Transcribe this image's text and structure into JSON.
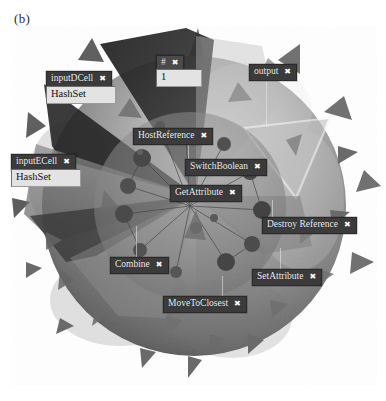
{
  "figure": {
    "panel_label": "(b)",
    "caption_color": "#2b2b2b",
    "background": "#ffffff",
    "width": 386,
    "height": 401
  },
  "scene": {
    "description": "grayscale 3D rendering of a spiky sphere with translucent radial cone wedges",
    "object_name": "spiky-sphere",
    "sphere_fill": "#8d8d8d",
    "sphere_highlight": "#d6d6d6",
    "sphere_shadow": "#4a4a4a",
    "spike_color": "#7a7a7a",
    "wedge_dark": "#2c2c2c",
    "wedge_mid": "#6a6a6a",
    "wedge_light": "#c9c9c9",
    "highlight_outline": "#f2f2f2"
  },
  "labels": [
    {
      "id": "inputdcell",
      "text": "inputDCell",
      "close": "✖",
      "x": 46,
      "y": 71,
      "style": "dark"
    },
    {
      "id": "hash-field-d",
      "text": "HashSet",
      "x": 46,
      "y": 84,
      "kind": "field"
    },
    {
      "id": "hash-symbol",
      "text": "#",
      "close": "✖",
      "x": 156,
      "y": 55,
      "style": "dark"
    },
    {
      "id": "hash-count-field",
      "text": "1",
      "x": 156,
      "y": 68,
      "kind": "field",
      "narrow": true
    },
    {
      "id": "output",
      "text": "output",
      "close": "✖",
      "x": 249,
      "y": 64,
      "style": "dark"
    },
    {
      "id": "hostreference",
      "text": "HostReference",
      "close": "✖",
      "x": 133,
      "y": 128,
      "style": "dark"
    },
    {
      "id": "inputecell",
      "text": "inputECell",
      "close": "✖",
      "x": 11,
      "y": 154,
      "style": "dark"
    },
    {
      "id": "hash-field-e",
      "text": "HashSet",
      "x": 11,
      "y": 167,
      "kind": "field"
    },
    {
      "id": "switchboolean",
      "text": "SwitchBoolean",
      "close": "✖",
      "x": 185,
      "y": 159,
      "style": "dark"
    },
    {
      "id": "getattribute",
      "text": "GetAttribute",
      "close": "✖",
      "x": 170,
      "y": 185,
      "style": "dark"
    },
    {
      "id": "destroyreference",
      "text": "Destroy Reference",
      "close": "✖",
      "x": 262,
      "y": 217,
      "style": "dark"
    },
    {
      "id": "combine",
      "text": "Combine",
      "close": "✖",
      "x": 110,
      "y": 257,
      "style": "dark"
    },
    {
      "id": "setattribute",
      "text": "SetAttribute",
      "close": "✖",
      "x": 252,
      "y": 269,
      "style": "dark"
    },
    {
      "id": "movetoclosest",
      "text": "MoveToClosest",
      "close": "✖",
      "x": 163,
      "y": 296,
      "style": "dark"
    }
  ]
}
